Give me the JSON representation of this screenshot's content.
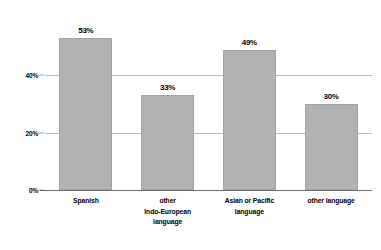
{
  "chart_data": {
    "type": "bar",
    "title": "",
    "xlabel": "",
    "ylabel": "",
    "ylim": [
      0,
      60
    ],
    "grid": true,
    "legend": false,
    "categories": [
      "Spanish",
      "other Indo-European language",
      "Asian or Pacific language",
      "other language"
    ],
    "category_lines": [
      [
        "Spanish"
      ],
      [
        "other",
        "Indo-European",
        "language"
      ],
      [
        "Asian or Pacific",
        "language"
      ],
      [
        "other language"
      ]
    ],
    "values": [
      53,
      33,
      49,
      30
    ],
    "value_labels": [
      "53%",
      "33%",
      "49%",
      "30%"
    ],
    "ytick_values": [
      0,
      20,
      40
    ],
    "ytick_labels": [
      "0%",
      "20%",
      "40%"
    ],
    "bar_color": "#b2b2b2",
    "bar_edge_color": "#a2a2a2",
    "gridline_color": "#b9b9b9",
    "axis_color": "#6e6e6e",
    "text_color": "#000000"
  }
}
